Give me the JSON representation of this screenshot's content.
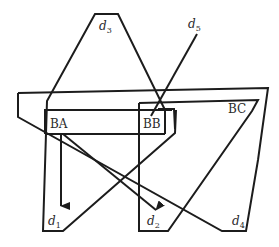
{
  "diagram": {
    "boxes": [
      {
        "id": "BA",
        "label": "BA"
      },
      {
        "id": "BB",
        "label": "BB"
      },
      {
        "id": "BC",
        "label": "BC"
      }
    ],
    "regions": [
      {
        "id": "d1",
        "label": "d",
        "subscript": "1"
      },
      {
        "id": "d2",
        "label": "d",
        "subscript": "2"
      },
      {
        "id": "d3",
        "label": "d",
        "subscript": "3"
      },
      {
        "id": "d4",
        "label": "d",
        "subscript": "4"
      },
      {
        "id": "d5",
        "label": "d",
        "subscript": "5"
      }
    ],
    "arrows": [
      {
        "from": "BA",
        "to": "d1"
      },
      {
        "from": "BA",
        "to": "d2"
      }
    ],
    "stroke_color": "#1c1c1c",
    "background_color": "#ffffff"
  }
}
